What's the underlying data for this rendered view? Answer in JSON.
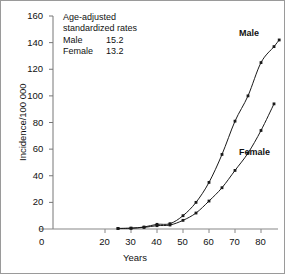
{
  "chart_data": {
    "type": "line",
    "title": "",
    "xlabel": "Years",
    "ylabel": "Incidence/100 000",
    "xlim": [
      0,
      90
    ],
    "ylim": [
      0,
      160
    ],
    "grid": false,
    "legend_position": "inline-at-curve-ends",
    "xticks": [
      0,
      20,
      30,
      40,
      50,
      60,
      70,
      80
    ],
    "yticks": [
      0,
      20,
      40,
      60,
      80,
      100,
      120,
      140,
      160
    ],
    "x": [
      25,
      30,
      35,
      40,
      45,
      50,
      55,
      60,
      65,
      70,
      75,
      80,
      85,
      87
    ],
    "series": [
      {
        "name": "Male",
        "label": "Male",
        "marker": "square",
        "color": "#1a1a1a",
        "values": [
          0.4,
          0.6,
          1.5,
          3.5,
          4.0,
          10.0,
          20.0,
          35.0,
          56.0,
          81.0,
          100.0,
          125.0,
          137.0,
          142.0
        ]
      },
      {
        "name": "Female",
        "label": "Female",
        "marker": "square",
        "color": "#1a1a1a",
        "values": [
          0.4,
          0.6,
          1.2,
          2.5,
          3.0,
          6.5,
          12.0,
          21.0,
          31.0,
          44.0,
          57.0,
          74.0,
          94.0,
          null
        ]
      }
    ],
    "annotation": {
      "line1": "Age-adjusted",
      "line2": "standardized rates",
      "rows": [
        {
          "label": "Male",
          "value": "15.2"
        },
        {
          "label": "Female",
          "value": "13.2"
        }
      ]
    }
  },
  "axis": {
    "y_title": "Incidence/100 000",
    "x_title": "Years",
    "y_tick_labels": [
      "160",
      "140",
      "120",
      "100",
      "80",
      "60",
      "40",
      "20",
      "0"
    ],
    "x_tick_labels": [
      "0",
      "20",
      "30",
      "40",
      "50",
      "60",
      "70",
      "80"
    ]
  },
  "labels": {
    "male": "Male",
    "female": "Female"
  },
  "annotation": {
    "line1": "Age-adjusted",
    "line2": "standardized rates",
    "male_label": "Male",
    "male_value": "15.2",
    "female_label": "Female",
    "female_value": "13.2"
  },
  "colors": {
    "ink": "#1a1a1a",
    "axis": "#777777",
    "frame": "#9a9a9a",
    "background": "#ffffff"
  }
}
